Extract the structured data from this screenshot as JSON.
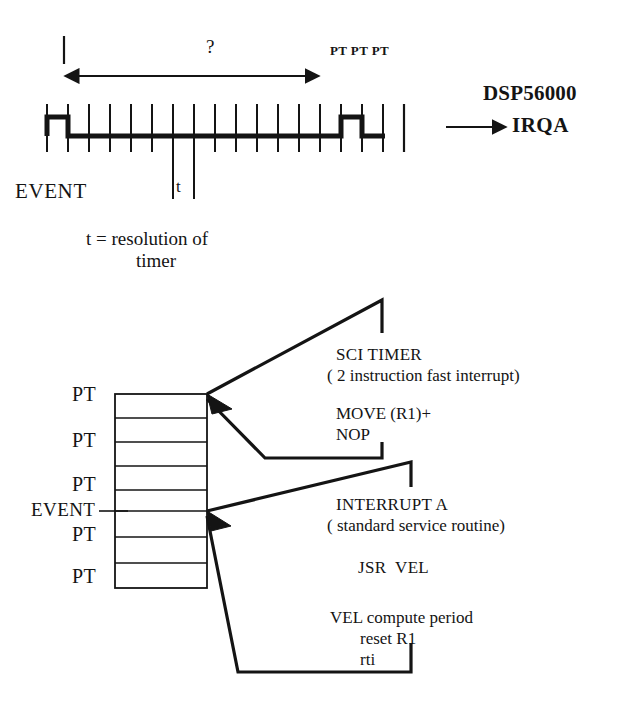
{
  "figure": {
    "title_hidden": "DSP56000 timer-resolution interrupt timing and stack diagram"
  },
  "timing": {
    "question_mark": "?",
    "pt_markers": "PT PT PT",
    "chip_name": "DSP56000",
    "irq_line": "IRQA",
    "event_label": "EVENT",
    "t_tick_label": "t",
    "legend_line1": "t = resolution of",
    "legend_line2": "timer"
  },
  "stack": {
    "labels": [
      {
        "text": "PT"
      },
      {
        "text": "PT"
      },
      {
        "text": "PT"
      },
      {
        "text": "EVENT"
      },
      {
        "text": "PT"
      },
      {
        "text": "PT"
      }
    ],
    "row_count": 8
  },
  "routines": {
    "sci": {
      "title": "SCI TIMER",
      "subtitle": "( 2 instruction fast interrupt)",
      "code_line1": "MOVE (R1)+",
      "code_line2": "NOP"
    },
    "interrupt_a": {
      "title": "INTERRUPT A",
      "subtitle": "( standard service routine)",
      "code_line1": "JSR  VEL",
      "code_line2": "VEL compute period",
      "code_line3": "reset R1",
      "code_line4": "rti"
    }
  },
  "colors": {
    "ink": "#141414",
    "background": "#ffffff"
  }
}
